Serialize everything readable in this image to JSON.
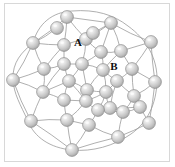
{
  "figure": {
    "type": "network-graph",
    "title": "",
    "background_color": "#ffffff",
    "frame_color": "#d8d8d8",
    "edge_color": "#9a9a9a",
    "node_fill_light": "#f0f0f0",
    "node_fill_mid": "#c9c9c9",
    "node_fill_dark": "#a8a8a8",
    "node_stroke_color": "#8c8c8c",
    "node_radius": 6.4,
    "node_count": 35,
    "edge_count": 60
  },
  "chart_data": {
    "type": "scatter",
    "title": "",
    "xlabel": "",
    "ylabel": "",
    "grid": false,
    "legend": false,
    "xlim": [
      0,
      175
    ],
    "ylim": [
      0,
      167
    ],
    "nodes": [
      {
        "id": "n0",
        "x": 67,
        "y": 17
      },
      {
        "id": "n1",
        "x": 111,
        "y": 23
      },
      {
        "id": "n2",
        "x": 33,
        "y": 43
      },
      {
        "id": "n3",
        "x": 64,
        "y": 45
      },
      {
        "id": "n4",
        "x": 86,
        "y": 39
      },
      {
        "id": "n5",
        "x": 151,
        "y": 42
      },
      {
        "id": "n6",
        "x": 101,
        "y": 52
      },
      {
        "id": "n7",
        "x": 121,
        "y": 51
      },
      {
        "id": "n8",
        "x": 44,
        "y": 69
      },
      {
        "id": "n9",
        "x": 64,
        "y": 64
      },
      {
        "id": "n10",
        "x": 82,
        "y": 64
      },
      {
        "id": "n11",
        "x": 103,
        "y": 70
      },
      {
        "id": "n12",
        "x": 132,
        "y": 69
      },
      {
        "id": "n13",
        "x": 13,
        "y": 80
      },
      {
        "id": "n14",
        "x": 43,
        "y": 92
      },
      {
        "id": "n15",
        "x": 69,
        "y": 81
      },
      {
        "id": "n16",
        "x": 117,
        "y": 81
      },
      {
        "id": "n17",
        "x": 155,
        "y": 82
      },
      {
        "id": "n18",
        "x": 87,
        "y": 90
      },
      {
        "id": "n19",
        "x": 106,
        "y": 92
      },
      {
        "id": "n20",
        "x": 64,
        "y": 100
      },
      {
        "id": "n21",
        "x": 86,
        "y": 101
      },
      {
        "id": "n22",
        "x": 110,
        "y": 108
      },
      {
        "id": "n23",
        "x": 134,
        "y": 96
      },
      {
        "id": "n24",
        "x": 98,
        "y": 110
      },
      {
        "id": "n25",
        "x": 123,
        "y": 112
      },
      {
        "id": "n26",
        "x": 31,
        "y": 121
      },
      {
        "id": "n27",
        "x": 67,
        "y": 120
      },
      {
        "id": "n28",
        "x": 89,
        "y": 125
      },
      {
        "id": "n29",
        "x": 149,
        "y": 123
      },
      {
        "id": "n30",
        "x": 118,
        "y": 137
      },
      {
        "id": "n31",
        "x": 72,
        "y": 150
      },
      {
        "id": "n32",
        "x": 57,
        "y": 28
      },
      {
        "id": "n33",
        "x": 93,
        "y": 33
      },
      {
        "id": "n34",
        "x": 140,
        "y": 107
      }
    ],
    "edges": [
      [
        "n0",
        "n2"
      ],
      [
        "n0",
        "n3"
      ],
      [
        "n0",
        "n1"
      ],
      [
        "n0",
        "n4"
      ],
      [
        "n1",
        "n5"
      ],
      [
        "n1",
        "n7"
      ],
      [
        "n1",
        "n4"
      ],
      [
        "n1",
        "n6"
      ],
      [
        "n2",
        "n3"
      ],
      [
        "n2",
        "n8"
      ],
      [
        "n2",
        "n13"
      ],
      [
        "n3",
        "n4"
      ],
      [
        "n3",
        "n9"
      ],
      [
        "n3",
        "n8"
      ],
      [
        "n4",
        "n6"
      ],
      [
        "n4",
        "n10"
      ],
      [
        "n5",
        "n12"
      ],
      [
        "n5",
        "n7"
      ],
      [
        "n5",
        "n17"
      ],
      [
        "n6",
        "n7"
      ],
      [
        "n6",
        "n11"
      ],
      [
        "n6",
        "n10"
      ],
      [
        "n7",
        "n12"
      ],
      [
        "n7",
        "n11"
      ],
      [
        "n8",
        "n9"
      ],
      [
        "n8",
        "n14"
      ],
      [
        "n8",
        "n13"
      ],
      [
        "n9",
        "n10"
      ],
      [
        "n9",
        "n15"
      ],
      [
        "n9",
        "n14"
      ],
      [
        "n10",
        "n11"
      ],
      [
        "n10",
        "n15"
      ],
      [
        "n10",
        "n18"
      ],
      [
        "n11",
        "n16"
      ],
      [
        "n11",
        "n18"
      ],
      [
        "n11",
        "n19"
      ],
      [
        "n12",
        "n16"
      ],
      [
        "n12",
        "n17"
      ],
      [
        "n12",
        "n23"
      ],
      [
        "n13",
        "n26"
      ],
      [
        "n13",
        "n14"
      ],
      [
        "n14",
        "n20"
      ],
      [
        "n14",
        "n15"
      ],
      [
        "n14",
        "n26"
      ],
      [
        "n15",
        "n20"
      ],
      [
        "n15",
        "n18"
      ],
      [
        "n15",
        "n21"
      ],
      [
        "n16",
        "n19"
      ],
      [
        "n16",
        "n23"
      ],
      [
        "n16",
        "n22"
      ],
      [
        "n17",
        "n23"
      ],
      [
        "n17",
        "n29"
      ],
      [
        "n18",
        "n21"
      ],
      [
        "n18",
        "n19"
      ],
      [
        "n19",
        "n22"
      ],
      [
        "n19",
        "n24"
      ],
      [
        "n19",
        "n21"
      ],
      [
        "n20",
        "n21"
      ],
      [
        "n20",
        "n27"
      ],
      [
        "n21",
        "n24"
      ],
      [
        "n21",
        "n27"
      ],
      [
        "n22",
        "n25"
      ],
      [
        "n22",
        "n24"
      ],
      [
        "n22",
        "n34"
      ],
      [
        "n23",
        "n34"
      ],
      [
        "n23",
        "n25"
      ],
      [
        "n24",
        "n28"
      ],
      [
        "n24",
        "n25"
      ],
      [
        "n25",
        "n30"
      ],
      [
        "n25",
        "n34"
      ],
      [
        "n26",
        "n27"
      ],
      [
        "n26",
        "n31"
      ],
      [
        "n27",
        "n28"
      ],
      [
        "n27",
        "n31"
      ],
      [
        "n28",
        "n30"
      ],
      [
        "n28",
        "n31"
      ],
      [
        "n29",
        "n30"
      ],
      [
        "n29",
        "n34"
      ],
      [
        "n30",
        "n31"
      ],
      [
        "n32",
        "n0"
      ],
      [
        "n32",
        "n2"
      ],
      [
        "n33",
        "n4"
      ],
      [
        "n33",
        "n1"
      ]
    ],
    "outer_ring": "M 33,43 C 38,24 52,12 72,11 C 96,9 114,15 128,26 C 146,39 158,58 157,82 C 156,104 148,122 131,134 C 114,146 92,152 72,150 C 50,148 34,137 28,121 C 20,104 14,94 13,80 C 12,62 22,52 33,43 Z",
    "annotations": [
      {
        "text": "A",
        "x": 78,
        "y": 46,
        "attached_node": "n4"
      },
      {
        "text": "B",
        "x": 114,
        "y": 70,
        "attached_node": "n11"
      }
    ]
  }
}
